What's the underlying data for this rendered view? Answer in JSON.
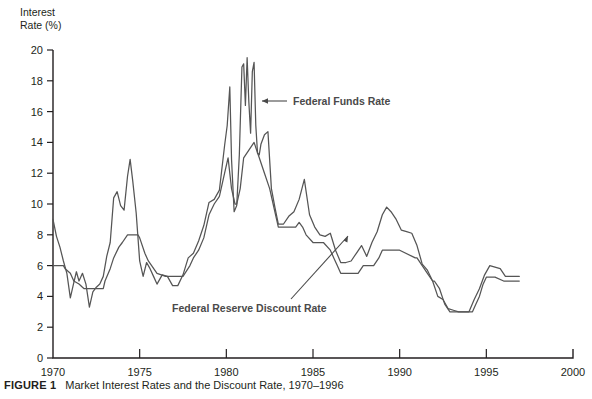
{
  "figure": {
    "caption_label": "FIGURE 1",
    "caption_text": "Market Interest Rates and the Discount Rate, 1970–1996",
    "y_axis_title": "Interest\nRate (%)"
  },
  "annotations": {
    "funds": "Federal Funds Rate",
    "discount": "Federal Reserve Discount Rate"
  },
  "colors": {
    "line": "#555555",
    "axis": "#231f20",
    "text": "#231f20",
    "annotation": "#4a4a4a"
  },
  "chart_data": {
    "type": "line",
    "title": "Market Interest Rates and the Discount Rate, 1970–1996",
    "xlabel": "",
    "ylabel": "Interest Rate (%)",
    "xlim": [
      1970,
      2000
    ],
    "ylim": [
      0,
      20
    ],
    "xticks": [
      1970,
      1975,
      1980,
      1985,
      1990,
      1995,
      2000
    ],
    "yticks": [
      0,
      2,
      4,
      6,
      8,
      10,
      12,
      14,
      16,
      18,
      20
    ],
    "grid": false,
    "legend": "annotations",
    "series": [
      {
        "name": "Federal Funds Rate",
        "x": [
          1970.0,
          1970.2,
          1970.4,
          1970.6,
          1970.8,
          1971.0,
          1971.2,
          1971.35,
          1971.5,
          1971.7,
          1971.9,
          1972.1,
          1972.3,
          1972.5,
          1972.7,
          1972.9,
          1973.1,
          1973.3,
          1973.5,
          1973.7,
          1973.9,
          1974.1,
          1974.3,
          1974.45,
          1974.6,
          1974.8,
          1975.0,
          1975.2,
          1975.4,
          1975.6,
          1975.8,
          1976.0,
          1976.3,
          1976.6,
          1976.9,
          1977.2,
          1977.5,
          1977.8,
          1978.1,
          1978.4,
          1978.7,
          1979.0,
          1979.3,
          1979.6,
          1979.9,
          1980.05,
          1980.2,
          1980.3,
          1980.45,
          1980.6,
          1980.75,
          1980.9,
          1981.0,
          1981.1,
          1981.2,
          1981.3,
          1981.4,
          1981.5,
          1981.6,
          1981.7,
          1981.8,
          1981.9,
          1982.0,
          1982.2,
          1982.4,
          1982.6,
          1982.8,
          1983.0,
          1983.3,
          1983.6,
          1983.9,
          1984.2,
          1984.5,
          1984.8,
          1985.1,
          1985.4,
          1985.7,
          1986.0,
          1986.3,
          1986.6,
          1986.9,
          1987.2,
          1987.5,
          1987.8,
          1988.1,
          1988.4,
          1988.7,
          1989.0,
          1989.25,
          1989.5,
          1989.8,
          1990.1,
          1990.4,
          1990.7,
          1991.0,
          1991.3,
          1991.6,
          1991.9,
          1992.2,
          1992.5,
          1992.8,
          1993.1,
          1993.4,
          1993.7,
          1994.0,
          1994.3,
          1994.6,
          1994.9,
          1995.2,
          1995.5,
          1995.8,
          1996.1,
          1996.4,
          1996.7,
          1996.9
        ],
        "y": [
          9.0,
          7.9,
          7.2,
          6.3,
          5.5,
          3.9,
          4.9,
          5.6,
          5.0,
          5.5,
          4.8,
          3.3,
          4.3,
          4.6,
          4.8,
          5.3,
          6.6,
          7.5,
          10.4,
          10.8,
          9.9,
          9.6,
          11.8,
          12.9,
          11.5,
          9.4,
          6.3,
          5.3,
          6.2,
          5.8,
          5.3,
          4.8,
          5.4,
          5.3,
          4.7,
          4.7,
          5.4,
          6.5,
          6.8,
          7.6,
          8.6,
          10.1,
          10.3,
          10.9,
          13.8,
          15.1,
          17.6,
          12.9,
          9.5,
          9.9,
          13.2,
          18.9,
          19.1,
          16.4,
          19.5,
          16.6,
          14.6,
          18.6,
          19.2,
          15.1,
          13.3,
          13.2,
          13.9,
          14.5,
          14.7,
          11.0,
          9.8,
          8.7,
          8.7,
          9.2,
          9.5,
          10.3,
          11.6,
          9.3,
          8.5,
          8.0,
          7.9,
          8.1,
          7.0,
          6.2,
          6.2,
          6.3,
          6.8,
          7.3,
          6.6,
          7.5,
          8.2,
          9.3,
          9.8,
          9.5,
          9.0,
          8.3,
          8.2,
          8.1,
          7.3,
          6.1,
          5.7,
          5.0,
          4.0,
          3.8,
          3.2,
          3.1,
          3.0,
          3.0,
          3.0,
          3.8,
          4.5,
          5.4,
          6.0,
          5.9,
          5.8,
          5.3,
          5.3,
          5.3,
          5.3
        ]
      },
      {
        "name": "Federal Reserve Discount Rate",
        "x": [
          1970.0,
          1970.6,
          1970.7,
          1971.0,
          1971.2,
          1971.5,
          1971.7,
          1971.8,
          1972.9,
          1973.0,
          1973.3,
          1973.5,
          1973.8,
          1974.0,
          1974.3,
          1974.5,
          1974.9,
          1975.0,
          1975.3,
          1975.5,
          1976.0,
          1976.5,
          1977.0,
          1977.5,
          1977.9,
          1978.1,
          1978.4,
          1978.7,
          1979.0,
          1979.3,
          1979.6,
          1979.9,
          1980.1,
          1980.3,
          1980.5,
          1980.6,
          1980.8,
          1981.0,
          1981.3,
          1981.6,
          1981.9,
          1982.2,
          1982.5,
          1982.7,
          1982.9,
          1983.0,
          1983.5,
          1984.0,
          1984.2,
          1984.4,
          1984.6,
          1985.0,
          1985.4,
          1985.6,
          1986.0,
          1986.2,
          1986.4,
          1986.6,
          1986.8,
          1987.0,
          1987.6,
          1987.9,
          1988.5,
          1988.8,
          1989.0,
          1989.3,
          1990.0,
          1990.9,
          1991.0,
          1991.3,
          1991.6,
          1991.9,
          1992.0,
          1992.3,
          1992.6,
          1992.9,
          1993.5,
          1994.2,
          1994.4,
          1994.6,
          1994.8,
          1995.0,
          1995.2,
          1995.5,
          1996.0,
          1996.2,
          1996.9
        ],
        "y": [
          6.0,
          6.0,
          5.8,
          5.5,
          5.0,
          4.8,
          4.6,
          4.5,
          4.5,
          5.0,
          5.8,
          6.5,
          7.2,
          7.5,
          8.0,
          8.0,
          8.0,
          7.8,
          6.8,
          6.3,
          5.5,
          5.3,
          5.3,
          5.3,
          6.0,
          6.5,
          7.0,
          7.8,
          9.3,
          10.0,
          10.5,
          12.0,
          13.0,
          11.0,
          10.0,
          10.0,
          11.0,
          13.0,
          13.5,
          14.0,
          13.0,
          12.0,
          11.0,
          10.0,
          9.0,
          8.5,
          8.5,
          8.5,
          8.8,
          8.5,
          8.0,
          7.5,
          7.5,
          7.5,
          7.0,
          6.5,
          6.0,
          5.5,
          5.5,
          5.5,
          5.5,
          6.0,
          6.0,
          6.5,
          7.0,
          7.0,
          7.0,
          6.5,
          6.5,
          6.0,
          5.5,
          5.0,
          5.0,
          4.5,
          3.5,
          3.0,
          3.0,
          3.0,
          3.5,
          4.0,
          4.75,
          5.25,
          5.25,
          5.25,
          5.0,
          5.0,
          5.0
        ]
      }
    ]
  },
  "geometry": {
    "plot_left": 53,
    "plot_right": 573,
    "plot_top": 50,
    "plot_bottom": 358
  }
}
